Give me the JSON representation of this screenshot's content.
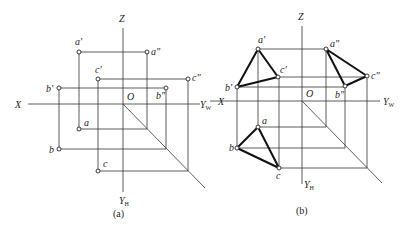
{
  "figures": [
    {
      "id": "a",
      "caption": "(a)",
      "axes": {
        "x_label": "X",
        "z_label": "Z",
        "origin_label": "O",
        "yw_label": "Y",
        "yw_sub": "W",
        "yh_label": "Y",
        "yh_sub": "H"
      },
      "points": {
        "a_v": {
          "label": "a'",
          "x": 79,
          "y": 52
        },
        "a_w": {
          "label": "a\"",
          "x": 147,
          "y": 52
        },
        "c_v": {
          "label": "c'",
          "x": 98,
          "y": 79
        },
        "c_w": {
          "label": "c\"",
          "x": 188,
          "y": 79
        },
        "b_v": {
          "label": "b'",
          "x": 59,
          "y": 88
        },
        "b_w": {
          "label": "b\"",
          "x": 166,
          "y": 88
        },
        "a_h": {
          "label": "a",
          "x": 79,
          "y": 129
        },
        "b_h": {
          "label": "b",
          "x": 59,
          "y": 149
        },
        "c_h": {
          "label": "c",
          "x": 98,
          "y": 171
        }
      },
      "triangles_drawn": false
    },
    {
      "id": "b",
      "caption": "(b)",
      "axes": {
        "x_label": "X",
        "z_label": "Z",
        "origin_label": "O",
        "yw_label": "Y",
        "yw_sub": "W",
        "yh_label": "Y",
        "yh_sub": "H"
      },
      "points": {
        "a_v": {
          "label": "a'",
          "x": 258,
          "y": 49
        },
        "a_w": {
          "label": "a\"",
          "x": 326,
          "y": 49
        },
        "c_v": {
          "label": "c'",
          "x": 278,
          "y": 77
        },
        "c_w": {
          "label": "c\"",
          "x": 367,
          "y": 76
        },
        "b_v": {
          "label": "b'",
          "x": 237,
          "y": 87
        },
        "b_w": {
          "label": "b\"",
          "x": 345,
          "y": 86
        },
        "a_h": {
          "label": "a",
          "x": 258,
          "y": 127
        },
        "b_h": {
          "label": "b",
          "x": 237,
          "y": 148
        },
        "c_h": {
          "label": "c",
          "x": 279,
          "y": 168
        }
      },
      "triangles_drawn": true
    }
  ]
}
